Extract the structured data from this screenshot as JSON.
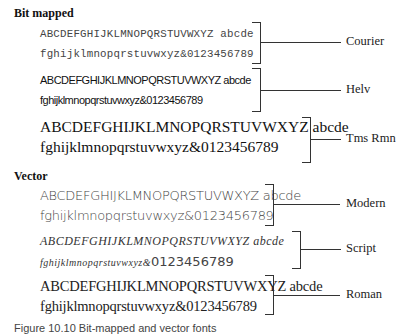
{
  "sections": {
    "bitmapped": {
      "title": "Bit mapped",
      "fonts": [
        {
          "name": "Courier",
          "line1": "ABCDEFGHIJKLMNOPQRSTUVWXYZ abcde",
          "line2": "fghijklmnopqrstuvwxyz&0123456789"
        },
        {
          "name": "Helv",
          "line1": "ABCDEFGHIJKLMNOPQRSTUVWXYZ abcde",
          "line2": "fghijklmnopqrstuvwxyz&0123456789"
        },
        {
          "name": "Tms Rmn",
          "line1": "ABCDEFGHIJKLMNOPQRSTUVWXYZ abcde",
          "line2": "fghijklmnopqrstuvwxyz&0123456789"
        }
      ]
    },
    "vector": {
      "title": "Vector",
      "fonts": [
        {
          "name": "Modern",
          "line1": "ABCDEFGHIJKLMNOPQRSTUVWXYZ abcde",
          "line2": "fghijklmnopqrstuvwxyz&0123456789"
        },
        {
          "name": "Script",
          "line1": "ABCDEFGHIJKLMNOPQRSTUVWXYZ abcde",
          "line2_script": "fghijklmnopqrstuvwxyz&",
          "line2_digits": "0123456789"
        },
        {
          "name": "Roman",
          "line1": "ABCDEFGHIJKLMNOPQRSTUVWXYZ abcde",
          "line2": "fghijklmnopqrstuvwxyz&0123456789"
        }
      ]
    }
  },
  "caption": "Figure 10.10  Bit-mapped and vector fonts"
}
